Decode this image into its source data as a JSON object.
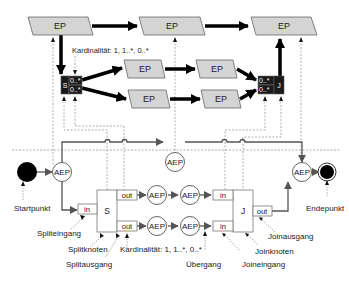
{
  "diagram": {
    "upper_level": {
      "ep_label": "EP",
      "top_row": [
        {
          "label": "EP"
        },
        {
          "label": "EP"
        },
        {
          "label": "EP"
        }
      ],
      "branch_1": [
        {
          "label": "EP"
        },
        {
          "label": "EP"
        }
      ],
      "branch_2": [
        {
          "label": "EP"
        },
        {
          "label": "EP"
        }
      ],
      "split_node": {
        "label": "S",
        "cardinalities": [
          "0..*",
          "0..*"
        ]
      },
      "join_node": {
        "label": "J",
        "cardinalities": [
          "0..*",
          "0..*"
        ]
      },
      "cardinality_annotation": "Kardinalität: 1, 1..*, 0..*"
    },
    "lower_level": {
      "aep_label": "AEP",
      "start_aep": "AEP",
      "top_aep": "AEP",
      "end_aep": "AEP",
      "branch_1_aeps": [
        "AEP",
        "AEP"
      ],
      "branch_2_aeps": [
        "AEP",
        "AEP"
      ],
      "split_node": {
        "label": "S",
        "in_port": "in",
        "out_ports": [
          "out",
          "out"
        ]
      },
      "join_node": {
        "label": "J",
        "in_ports": [
          "in",
          "in"
        ],
        "out_port": "out"
      }
    },
    "annotations": {
      "start": "Startpunkt",
      "end": "Endepunkt",
      "split_input": "Spliteingang",
      "split_node": "Splitknoten",
      "split_output": "Splitausgang",
      "cardinality": "Kardinalität: 1, 1..*, 0..*",
      "transition": "Übergang",
      "join_input": "Joineingang",
      "join_node": "Joinknoten",
      "join_output": "Joinausgang"
    },
    "colors": {
      "ep_fill": "#d4d4d4",
      "stroke": "#555555",
      "thick_arrow": "#000000",
      "dashed": "#999999",
      "start_fill": "#000000",
      "card_cell": "#1a1a1a"
    }
  }
}
